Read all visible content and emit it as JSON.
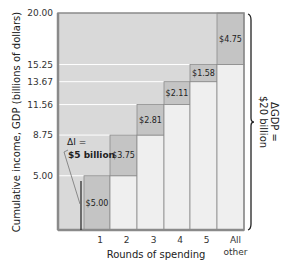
{
  "chart_data": {
    "type": "bar",
    "subtype": "stacked-cumulative-step",
    "title": "",
    "xlabel": "Rounds of spending",
    "ylabel": "Cumulative income, GDP (billions of dollars)",
    "categories": [
      "1",
      "2",
      "3",
      "4",
      "5",
      "All other"
    ],
    "series": [
      {
        "name": "Cumulative base",
        "values": [
          0,
          5.0,
          8.75,
          11.56,
          13.67,
          15.25
        ]
      },
      {
        "name": "Increment per round",
        "values": [
          5.0,
          3.75,
          2.81,
          2.11,
          1.58,
          4.75
        ]
      }
    ],
    "increment_labels": [
      "$5.00",
      "$3.75",
      "$2.81",
      "$2.11",
      "$1.58",
      "$4.75"
    ],
    "y_ticks": [
      "5.00",
      "8.75",
      "11.56",
      "13.67",
      "15.25",
      "20.00"
    ],
    "y_tick_values": [
      5.0,
      8.75,
      11.56,
      13.67,
      15.25,
      20.0
    ],
    "ylim": [
      0,
      20
    ],
    "grid": false,
    "annotations": {
      "delta_i": {
        "line1": "ΔI =",
        "line2": "$5 billion"
      },
      "delta_gdp": {
        "line1": "ΔGDP =",
        "line2": "$20 billion"
      }
    },
    "colors": {
      "plot_bg": "#d9d9d9",
      "increment_fill": "#c4c4c4",
      "base_fill": "#efefef",
      "frame": "#8a8a8a",
      "divider": "#8c8c8c",
      "guide_line": "#ffffff"
    }
  }
}
